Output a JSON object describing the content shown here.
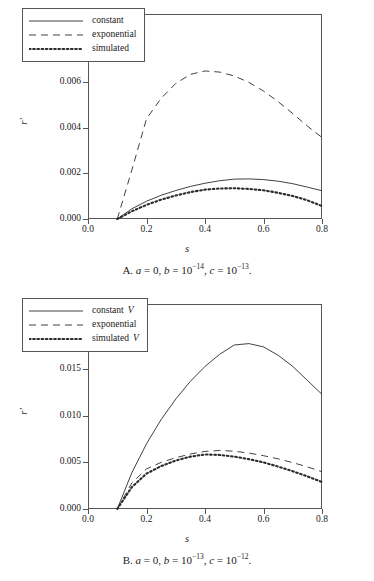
{
  "figure": {
    "panels": [
      {
        "id": "A",
        "caption": {
          "prefix": "A.",
          "terms": [
            {
              "var": "a",
              "value": "0",
              "exp": ""
            },
            {
              "var": "b",
              "value": "10",
              "exp": "−14"
            },
            {
              "var": "c",
              "value": "10",
              "exp": "−13"
            }
          ],
          "plain": "A. a = 0, b = 10⁻¹⁴, c = 10⁻¹³."
        },
        "chart_data": {
          "type": "line",
          "title": "",
          "xlabel": "s",
          "ylabel": "r'",
          "xlim": [
            0.0,
            0.8
          ],
          "ylim": [
            0.0,
            0.009
          ],
          "xticks": [
            "0.0",
            "0.2",
            "0.4",
            "0.6",
            "0.8"
          ],
          "xtick_values": [
            0.0,
            0.2,
            0.4,
            0.6,
            0.8
          ],
          "yticks": [
            "0.000",
            "0.002",
            "0.004",
            "0.006",
            "0.008"
          ],
          "ytick_values": [
            0.0,
            0.002,
            0.004,
            0.006,
            0.008
          ],
          "grid": false,
          "legend_position": "top-left",
          "x": [
            0.1,
            0.15,
            0.2,
            0.25,
            0.3,
            0.35,
            0.4,
            0.45,
            0.5,
            0.55,
            0.6,
            0.65,
            0.7,
            0.75,
            0.8
          ],
          "series": [
            {
              "name": "constant",
              "style": "solid",
              "values": [
                0.0,
                0.00045,
                0.00078,
                0.00104,
                0.00125,
                0.00143,
                0.00157,
                0.00168,
                0.00175,
                0.00176,
                0.00173,
                0.00166,
                0.00155,
                0.0014,
                0.00124
              ]
            },
            {
              "name": "exponential",
              "style": "dashed",
              "values": [
                0.0,
                0.00215,
                0.0044,
                0.0053,
                0.00595,
                0.00635,
                0.0065,
                0.00645,
                0.00628,
                0.006,
                0.00562,
                0.00515,
                0.00463,
                0.00408,
                0.00358
              ]
            },
            {
              "name": "simulated",
              "style": "dotted",
              "values": [
                0.0,
                0.00034,
                0.00062,
                0.00085,
                0.00103,
                0.00118,
                0.00129,
                0.00134,
                0.00135,
                0.00132,
                0.00126,
                0.00115,
                0.00101,
                0.00082,
                0.00057
              ]
            }
          ]
        }
      },
      {
        "id": "B",
        "caption": {
          "prefix": "B.",
          "terms": [
            {
              "var": "a",
              "value": "0",
              "exp": ""
            },
            {
              "var": "b",
              "value": "10",
              "exp": "−13"
            },
            {
              "var": "c",
              "value": "10",
              "exp": "−12"
            }
          ],
          "plain": "B. a = 0, b = 10⁻¹³, c = 10⁻¹²."
        },
        "chart_data": {
          "type": "line",
          "title": "",
          "xlabel": "s",
          "ylabel": "r'",
          "xlim": [
            0.0,
            0.8
          ],
          "ylim": [
            0.0,
            0.022
          ],
          "xticks": [
            "0.0",
            "0.2",
            "0.4",
            "0.6",
            "0.8"
          ],
          "xtick_values": [
            0.0,
            0.2,
            0.4,
            0.6,
            0.8
          ],
          "yticks": [
            "0.000",
            "0.005",
            "0.010",
            "0.015",
            "0.020"
          ],
          "ytick_values": [
            0.0,
            0.005,
            0.01,
            0.015,
            0.02
          ],
          "grid": false,
          "legend_position": "top-left",
          "x": [
            0.1,
            0.15,
            0.2,
            0.25,
            0.3,
            0.35,
            0.4,
            0.45,
            0.5,
            0.55,
            0.6,
            0.65,
            0.7,
            0.75,
            0.8
          ],
          "series": [
            {
              "name": "constant V",
              "label_main": "constant",
              "label_italic": "V",
              "style": "solid",
              "values": [
                0.0,
                0.0039,
                0.007,
                0.0096,
                0.0118,
                0.0137,
                0.0153,
                0.0166,
                0.0176,
                0.01775,
                0.0174,
                0.0165,
                0.0153,
                0.0138,
                0.0123
              ]
            },
            {
              "name": "exponential",
              "label_main": "exponential",
              "label_italic": "",
              "style": "dashed",
              "values": [
                0.0,
                0.0028,
                0.0043,
                0.005,
                0.0055,
                0.0059,
                0.00618,
                0.00628,
                0.0062,
                0.006,
                0.00572,
                0.00538,
                0.00498,
                0.00452,
                0.004
              ]
            },
            {
              "name": "simulated V",
              "label_main": "simulated",
              "label_italic": "V",
              "style": "dotted",
              "values": [
                0.0,
                0.00235,
                0.0038,
                0.0046,
                0.0052,
                0.00562,
                0.00585,
                0.0058,
                0.00562,
                0.00535,
                0.005,
                0.00455,
                0.00405,
                0.0035,
                0.0029
              ]
            }
          ]
        }
      }
    ]
  }
}
